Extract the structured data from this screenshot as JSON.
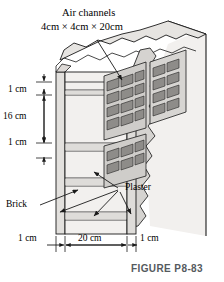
{
  "figure": {
    "caption": "FIGURE P8-83",
    "title_line1": "Air channels",
    "title_line2": "4cm × 4cm × 20cm",
    "labels": {
      "brick": "Brick",
      "plaster": "Plaster"
    },
    "vertical_dimensions": [
      {
        "id": "top-plaster",
        "value": "1 cm"
      },
      {
        "id": "brick-height",
        "value": "16 cm"
      },
      {
        "id": "bottom-plaster",
        "value": "1 cm"
      }
    ],
    "horizontal_dimensions": [
      {
        "id": "left-plaster",
        "value": "1 cm"
      },
      {
        "id": "brick-depth",
        "value": "20 cm"
      },
      {
        "id": "right-plaster",
        "value": "1 cm"
      }
    ],
    "colors": {
      "line": "#1a1a1a",
      "fill_light": "#f2f0ee",
      "fill_mid": "#e0dedb",
      "fill_dark": "#c9c7c4",
      "channel": "#8e8c89",
      "caption": "#555a5e",
      "background": "#ffffff"
    }
  }
}
